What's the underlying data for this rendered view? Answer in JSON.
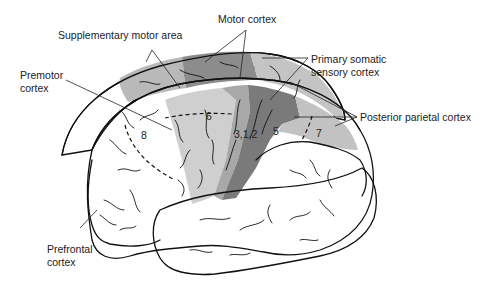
{
  "diagram": {
    "type": "anatomical-illustration",
    "labels": {
      "motor_cortex": "Motor cortex",
      "supplementary_motor_area": "Supplementary motor area",
      "primary_somatic_sensory_line1": "Primary somatic",
      "primary_somatic_sensory_line2": "sensory cortex",
      "premotor_line1": "Premotor",
      "premotor_line2": "cortex",
      "posterior_parietal": "Posterior parietal cortex",
      "prefrontal_line1": "Prefrontal",
      "prefrontal_line2": "cortex"
    },
    "area_numbers": {
      "area_6": "6",
      "area_8": "8",
      "area_312": "3,1,2",
      "area_5": "5",
      "area_7": "7"
    },
    "colors": {
      "background": "#ffffff",
      "outline": "#111111",
      "motor_cortex_fill": "#8c8c8c",
      "supplementary_motor_fill": "#b9b9b9",
      "premotor_fill": "#cfcfcf",
      "somatic_sensory_fill": "#7a7a7a",
      "somatic_sensory_medial_fill": "#c4c4c4",
      "posterior_parietal_fill": "#c2c2c2",
      "unshaded_fill": "#ffffff"
    }
  }
}
